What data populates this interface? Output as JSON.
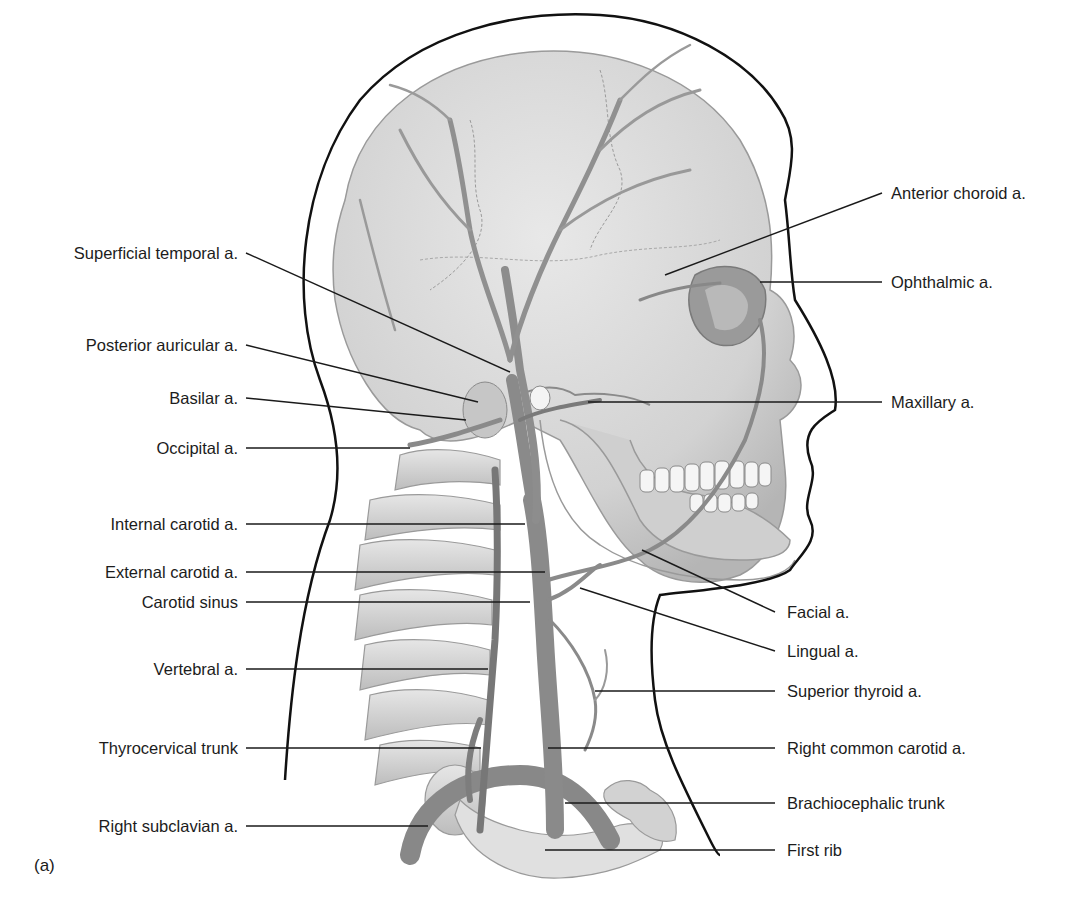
{
  "figure": {
    "panel_label": "(a)",
    "colors": {
      "background": "#ffffff",
      "outline": "#111111",
      "bone": "#d9d9d9",
      "bone_shadow": "#b8b8b8",
      "artery": "#8c8c8c",
      "artery_dark": "#6e6e6e",
      "leader_line": "#1a1a1a"
    },
    "labels_left": [
      {
        "text": "Superficial temporal a.",
        "y": 253
      },
      {
        "text": "Posterior auricular a.",
        "y": 345
      },
      {
        "text": "Basilar a.",
        "y": 398
      },
      {
        "text": "Occipital a.",
        "y": 448
      },
      {
        "text": "Internal carotid a.",
        "y": 524
      },
      {
        "text": "External carotid a.",
        "y": 572
      },
      {
        "text": "Carotid sinus",
        "y": 602
      },
      {
        "text": "Vertebral a.",
        "y": 669
      },
      {
        "text": "Thyrocervical trunk",
        "y": 748
      },
      {
        "text": "Right subclavian a.",
        "y": 826
      }
    ],
    "labels_right": [
      {
        "text": "Anterior choroid a.",
        "y": 193
      },
      {
        "text": "Ophthalmic a.",
        "y": 282
      },
      {
        "text": "Maxillary a.",
        "y": 402
      },
      {
        "text": "Facial a.",
        "y": 612
      },
      {
        "text": "Lingual a.",
        "y": 651
      },
      {
        "text": "Superior thyroid a.",
        "y": 691
      },
      {
        "text": "Right common carotid a.",
        "y": 748
      },
      {
        "text": "Brachiocephalic trunk",
        "y": 803
      },
      {
        "text": "First rib",
        "y": 850
      }
    ]
  }
}
